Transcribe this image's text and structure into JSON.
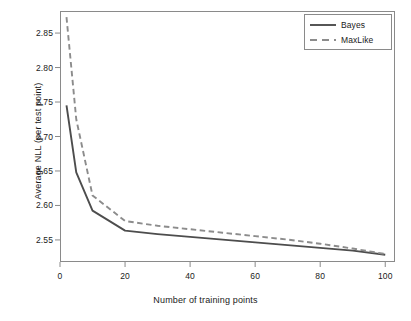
{
  "chart_data": {
    "type": "line",
    "title": "",
    "xlabel": "Number of training points",
    "ylabel": "Average NLL (per test point)",
    "xlim": [
      0,
      103
    ],
    "ylim": [
      2.518,
      2.882
    ],
    "grid": false,
    "legend_position": "top-right",
    "xticks": [
      0,
      20,
      40,
      60,
      80,
      100
    ],
    "xticklabels": [
      "0",
      "20",
      "40",
      "60",
      "80",
      "100"
    ],
    "yticks": [
      2.55,
      2.6,
      2.65,
      2.7,
      2.75,
      2.8,
      2.85
    ],
    "yticklabels": [
      "2.55",
      "2.60",
      "2.65",
      "2.70",
      "2.75",
      "2.80",
      "2.85"
    ],
    "series": [
      {
        "name": "Bayes",
        "style": "solid",
        "color": "#4d4d4d",
        "x": [
          2,
          5,
          10,
          20,
          30,
          40,
          50,
          60,
          70,
          80,
          90,
          100
        ],
        "values": [
          2.745,
          2.648,
          2.5925,
          2.5635,
          2.5585,
          2.5545,
          2.5505,
          2.5465,
          2.5425,
          2.5385,
          2.5345,
          2.5285
        ]
      },
      {
        "name": "MaxLike",
        "style": "dashed",
        "color": "#8c8c8c",
        "x": [
          2,
          5,
          10,
          20,
          30,
          40,
          50,
          60,
          70,
          80,
          90,
          100
        ],
        "values": [
          2.873,
          2.725,
          2.6145,
          2.5775,
          2.5705,
          2.5655,
          2.5605,
          2.5555,
          2.5505,
          2.5445,
          2.5375,
          2.5295
        ]
      }
    ]
  },
  "legend": {
    "entries": [
      {
        "label": "Bayes",
        "key": "solid-line-key"
      },
      {
        "label": "MaxLike",
        "key": "dashed-line-key"
      }
    ]
  },
  "axes": {
    "x_title": "Number of training points",
    "y_title": "Average NLL (per test point)",
    "x_tick_labels": [
      "0",
      "20",
      "40",
      "60",
      "80",
      "100"
    ],
    "y_tick_labels": [
      "2.55",
      "2.60",
      "2.65",
      "2.70",
      "2.75",
      "2.80",
      "2.85"
    ]
  },
  "colors": {
    "bayes": "#4d4d4d",
    "maxlike": "#8c8c8c",
    "frame": "#8a8a8a",
    "text": "#1a1a1a",
    "background": "#ffffff"
  }
}
